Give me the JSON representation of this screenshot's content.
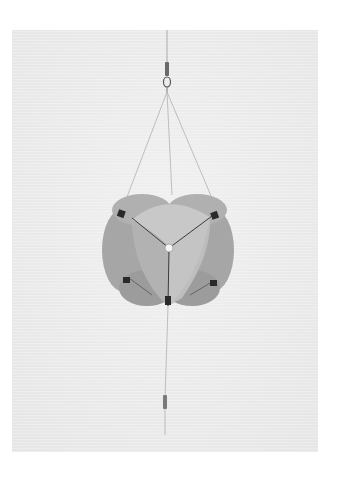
{
  "image": {
    "subject": "radar reflector hanging on line",
    "background_color": "#ececec",
    "page_color": "#ffffff",
    "object_color": "#b8b8b8",
    "object_shadow_color": "#9a9a9a",
    "clip_color": "#2a2a2a"
  }
}
